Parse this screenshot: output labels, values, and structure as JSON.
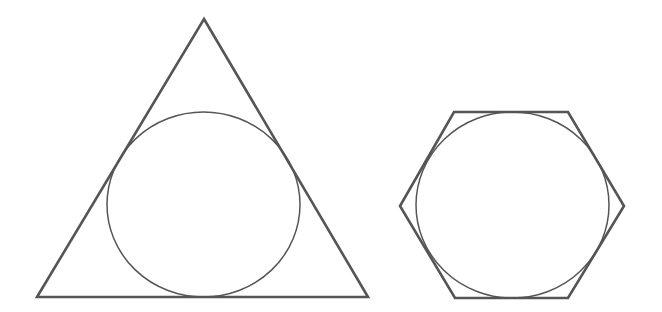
{
  "diagram": {
    "width": 662,
    "height": 312,
    "background": "#ffffff",
    "stroke_color": "#555555",
    "figures": [
      {
        "id": "triangle-with-incircle",
        "polygon": {
          "shape": "equilateral-triangle",
          "points": [
            [
              204,
              19
            ],
            [
              368,
              297
            ],
            [
              37,
              297
            ]
          ],
          "stroke_width": 2.6
        },
        "circle": {
          "shape": "inscribed-circle",
          "cx": 203.5,
          "cy": 204.5,
          "rx": 96.5,
          "ry": 92.5,
          "stroke_width": 1.5
        }
      },
      {
        "id": "hexagon-with-incircle",
        "polygon": {
          "shape": "regular-hexagon",
          "points": [
            [
              454,
              112
            ],
            [
              568,
              112
            ],
            [
              624,
              206
            ],
            [
              568,
              298
            ],
            [
              455,
              298
            ],
            [
              400,
              206
            ]
          ],
          "stroke_width": 2.6
        },
        "circle": {
          "shape": "inscribed-circle",
          "cx": 512.5,
          "cy": 205,
          "rx": 96.5,
          "ry": 93,
          "stroke_width": 1.5
        }
      }
    ]
  }
}
